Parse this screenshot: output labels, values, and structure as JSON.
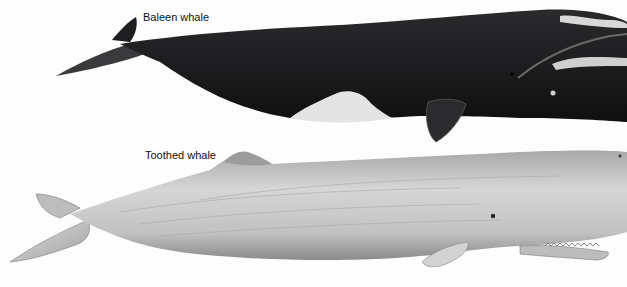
{
  "figure": {
    "labels": {
      "baleen": "Baleen whale",
      "toothed": "Toothed whale"
    },
    "colors": {
      "baleen_body": "#1c1c1e",
      "baleen_belly": "#e6e6e6",
      "toothed_body": "#c9c9c9",
      "toothed_shade": "#8f8f8f",
      "background": "#fdfdfd"
    }
  }
}
